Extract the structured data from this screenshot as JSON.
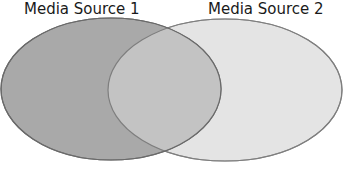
{
  "diagram": {
    "type": "venn",
    "sets": [
      {
        "label": "Media Source 1",
        "fill": "#a8a8a8",
        "stroke": "#6a6a6a"
      },
      {
        "label": "Media Source 2",
        "fill": "#e4e4e4",
        "stroke": "#8a8a8a"
      }
    ],
    "overlap_fill": "#c2c2c2"
  }
}
